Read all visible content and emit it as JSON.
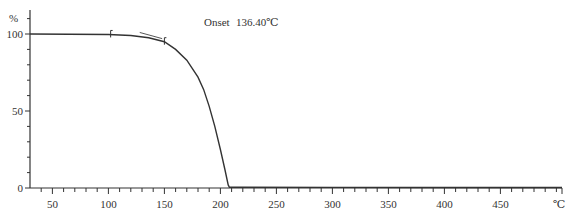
{
  "chart_data": {
    "type": "line",
    "title": "",
    "annotation": {
      "label": "Onset",
      "value": "136.40℃",
      "onset_temperature": 136.4
    },
    "xlabel": "℃",
    "ylabel": "%",
    "xlim": [
      30,
      505
    ],
    "ylim": [
      0,
      110
    ],
    "x_ticks_major": [
      50,
      100,
      150,
      200,
      250,
      300,
      350,
      400,
      450
    ],
    "x_tick_labels": [
      "50",
      "100",
      "150",
      "200",
      "250",
      "300",
      "350",
      "400",
      "450"
    ],
    "x_ticks_minor_step": 10,
    "y_ticks_major": [
      0,
      50,
      100
    ],
    "y_tick_labels": [
      "0",
      "50",
      "100"
    ],
    "y_ticks_minor_step": 10,
    "grid": false,
    "legend": null,
    "series": [
      {
        "name": "TGA weight %",
        "x": [
          30,
          100,
          120,
          136,
          150,
          160,
          170,
          180,
          185,
          190,
          195,
          200,
          204,
          207,
          208,
          220,
          300,
          400,
          505
        ],
        "y": [
          100,
          99.7,
          99,
          97.5,
          95,
          90,
          83,
          72,
          64,
          53,
          40,
          25,
          12,
          2,
          0.5,
          0.5,
          0.4,
          0.3,
          0.3
        ]
      }
    ],
    "markers": [
      {
        "x": 102,
        "y": 99.7
      },
      {
        "x": 150,
        "y": 95
      }
    ],
    "tangent_line": {
      "x": [
        128,
        148
      ],
      "y": [
        101,
        97
      ]
    }
  },
  "labels": {
    "y_unit": "%",
    "x_unit": "℃",
    "onset_label": "Onset",
    "onset_value": "136.40℃"
  }
}
